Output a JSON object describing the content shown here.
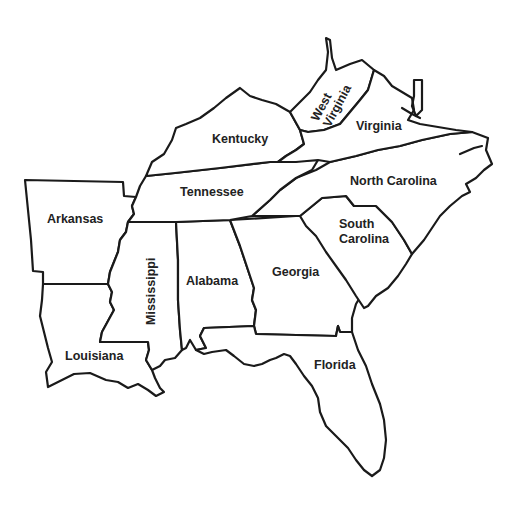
{
  "map": {
    "title": "Southeastern United States",
    "colors": {
      "background": "#ffffff",
      "border": "#1a1a1a",
      "label": "#222222"
    },
    "states": [
      {
        "id": "west-virginia",
        "label_lines": [
          "West",
          "Virginia"
        ]
      },
      {
        "id": "virginia",
        "label_lines": [
          "Virginia"
        ]
      },
      {
        "id": "kentucky",
        "label_lines": [
          "Kentucky"
        ]
      },
      {
        "id": "tennessee",
        "label_lines": [
          "Tennessee"
        ]
      },
      {
        "id": "north-carolina",
        "label_lines": [
          "North Carolina"
        ]
      },
      {
        "id": "south-carolina",
        "label_lines": [
          "South",
          "Carolina"
        ]
      },
      {
        "id": "arkansas",
        "label_lines": [
          "Arkansas"
        ]
      },
      {
        "id": "mississippi",
        "label_lines": [
          "Mississippi"
        ]
      },
      {
        "id": "alabama",
        "label_lines": [
          "Alabama"
        ]
      },
      {
        "id": "georgia",
        "label_lines": [
          "Georgia"
        ]
      },
      {
        "id": "louisiana",
        "label_lines": [
          "Louisiana"
        ]
      },
      {
        "id": "florida",
        "label_lines": [
          "Florida"
        ]
      }
    ]
  }
}
